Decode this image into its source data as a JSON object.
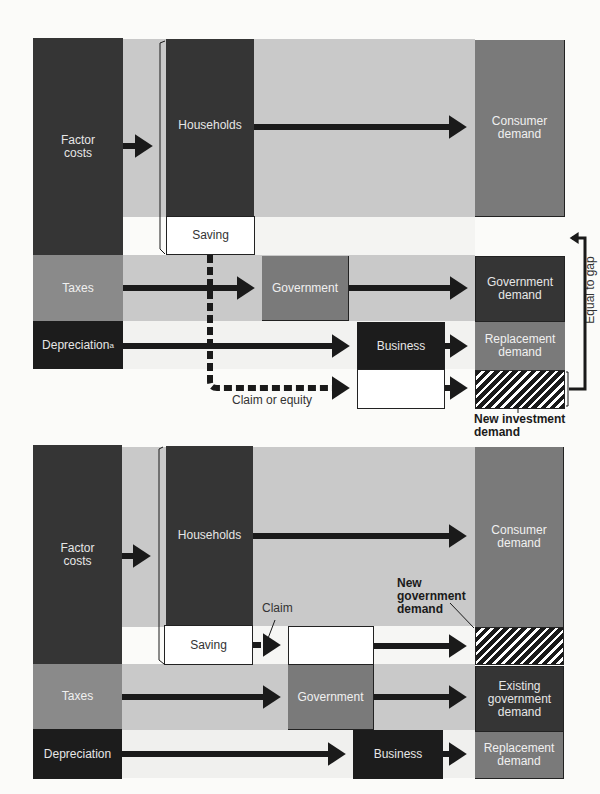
{
  "top": {
    "factor_costs": "Factor\ncosts",
    "households": "Households",
    "saving": "Saving",
    "consumer_demand": "Consumer\ndemand",
    "taxes": "Taxes",
    "government": "Government",
    "government_demand": "Government\ndemand",
    "depreciation": "Depreciation",
    "depreciation_note": "a",
    "business": "Business",
    "replacement_demand": "Replacement\ndemand",
    "claim_or_equity": "Claim or equity",
    "new_investment_demand": "New investment\ndemand",
    "equal_to_gap": "Equal to gap"
  },
  "bottom": {
    "factor_costs": "Factor\ncosts",
    "households": "Households",
    "saving": "Saving",
    "claim": "Claim",
    "consumer_demand": "Consumer\ndemand",
    "new_government_demand": "New\ngovernment\ndemand",
    "taxes": "Taxes",
    "government": "Government",
    "existing_government_demand": "Existing\ngovernment\ndemand",
    "depreciation": "Depreciation",
    "business": "Business",
    "replacement_demand": "Replacement\ndemand"
  }
}
